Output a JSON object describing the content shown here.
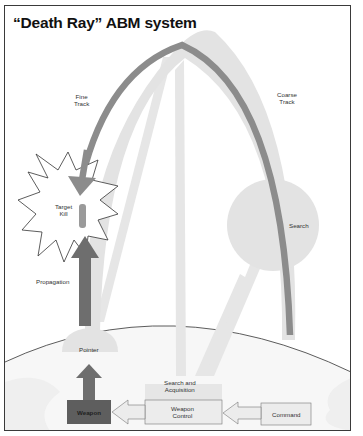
{
  "title": "“Death Ray” ABM system",
  "labels": {
    "fine_track_1": "Fine",
    "fine_track_2": "Track",
    "coarse_track_1": "Coarse",
    "coarse_track_2": "Track",
    "target_kill_1": "Target",
    "target_kill_2": "Kill",
    "search": "Search",
    "propagation": "Propagation",
    "pointer": "Pointer",
    "search_acq_1": "Search and",
    "search_acq_2": "Acquisition",
    "weapon": "Weapon",
    "weapon_control_1": "Weapon",
    "weapon_control_2": "Control",
    "command": "Command"
  },
  "colors": {
    "beam_light": "#e4e4e4",
    "track_mid": "#8f8f8f",
    "propagation_dark": "#6e6e6e",
    "weapon_box": "#5e5e5e",
    "box_fill": "#ececec",
    "frame": "#3a3a3a"
  },
  "flow": [
    "Command",
    "Weapon Control",
    "Weapon",
    "Pointer",
    "Propagation",
    "Target Kill"
  ]
}
